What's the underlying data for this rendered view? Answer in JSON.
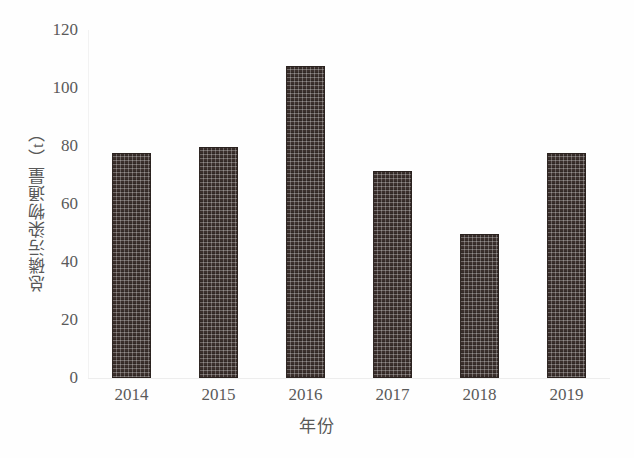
{
  "chart_data": {
    "type": "bar",
    "title": "",
    "xlabel": "年份",
    "ylabel": "总磷污染物通量（t）",
    "categories": [
      "2014",
      "2015",
      "2016",
      "2017",
      "2018",
      "2019"
    ],
    "values": [
      77.5,
      79.5,
      107.5,
      71.5,
      49.5,
      77.5
    ],
    "series": [
      {
        "name": "总磷污染物通量",
        "values": [
          77.5,
          79.5,
          107.5,
          71.5,
          49.5,
          77.5
        ]
      }
    ],
    "ylim": [
      0,
      120
    ],
    "yticks": [
      0,
      20,
      40,
      60,
      80,
      100,
      120
    ],
    "ytick_labels": [
      "0",
      "20",
      "40",
      "60",
      "80",
      "100",
      "120"
    ],
    "grid": false,
    "legend": false,
    "legend_position": "none",
    "bar_color": "#3a2f2c",
    "bar_pattern": "dotted-checker",
    "background_color": "#fefefe",
    "text_color": "#5a5a5a"
  }
}
